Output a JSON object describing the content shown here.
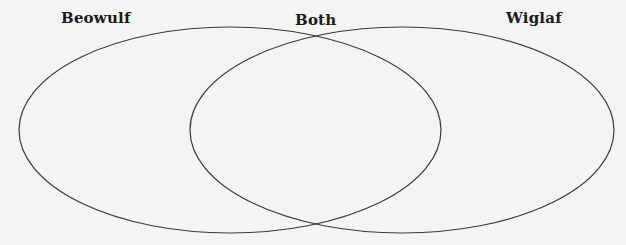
{
  "diagram": {
    "type": "venn",
    "labels": {
      "left": "Beowulf",
      "middle": "Both",
      "right": "Wiglaf"
    },
    "sets": [
      {
        "name": "Beowulf",
        "cx": 230,
        "cy": 130,
        "rx": 211,
        "ry": 103
      },
      {
        "name": "Wiglaf",
        "cx": 402,
        "cy": 130,
        "rx": 212,
        "ry": 103
      }
    ],
    "colors": {
      "background": "#f4f4f3",
      "stroke": "#3a3a3a",
      "text": "#1a1a1a"
    }
  }
}
